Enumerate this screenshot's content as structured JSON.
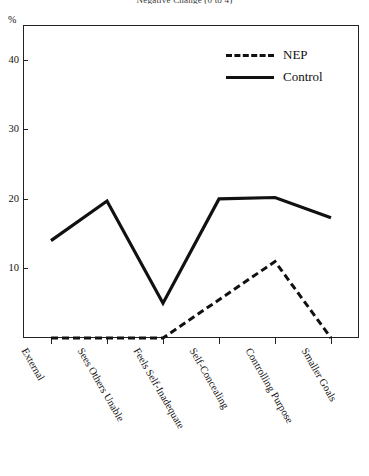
{
  "chart_data": {
    "type": "line",
    "title": "Negative Change (0 to 4)",
    "xlabel": "",
    "ylabel": "%",
    "ylim": [
      0,
      45
    ],
    "yticks": [
      10,
      20,
      30,
      40
    ],
    "grid": false,
    "legend_position": "top-right",
    "categories": [
      "External",
      "Sees Others Unable",
      "Feels Self-Inadequate",
      "Self-Concealing",
      "Controlling Purpose",
      "Smaller Goals"
    ],
    "series": [
      {
        "name": "NEP",
        "style": "dashed",
        "color": "#111111",
        "values": [
          0,
          0,
          0,
          5.5,
          11,
          0
        ]
      },
      {
        "name": "Control",
        "style": "solid",
        "color": "#111111",
        "values": [
          14,
          19.7,
          5,
          20,
          20.2,
          17.3
        ]
      }
    ]
  },
  "axis": {
    "unit_label": "%",
    "ytick_labels": [
      "10",
      "20",
      "30",
      "40"
    ]
  },
  "legend": {
    "entries": [
      {
        "label": "NEP",
        "style": "dashed"
      },
      {
        "label": "Control",
        "style": "solid"
      }
    ]
  }
}
